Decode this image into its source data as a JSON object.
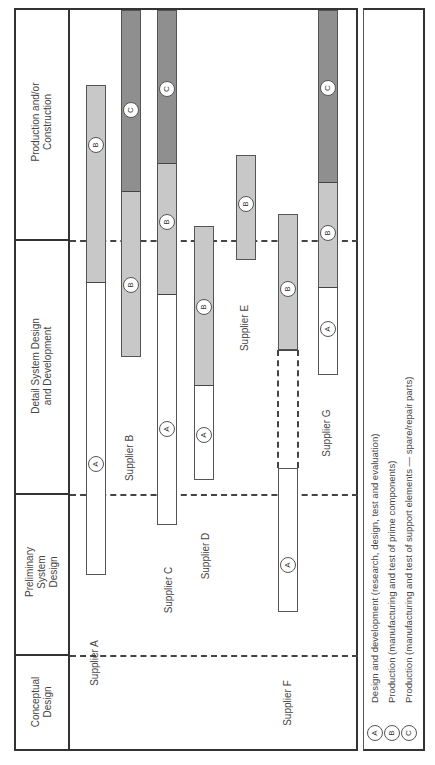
{
  "phases": [
    {
      "key": "production",
      "label": "Production and/or\nConstruction",
      "line1": "Production and/or",
      "line2": "Construction"
    },
    {
      "key": "detail",
      "label": "Detail System Design and Development",
      "line1": "Detail System Design",
      "line2": "and Development"
    },
    {
      "key": "preliminary",
      "label": "Preliminary System Design",
      "line1": "Preliminary",
      "line2": "System",
      "line3": "Design"
    },
    {
      "key": "conceptual",
      "label": "Conceptual Design",
      "line1": "Conceptual",
      "line2": "Design"
    }
  ],
  "suppliers": [
    {
      "name": "Supplier A",
      "segments": [
        {
          "type": "B",
          "label": "B"
        },
        {
          "type": "A",
          "label": "A"
        }
      ]
    },
    {
      "name": "Supplier B",
      "segments": [
        {
          "type": "C",
          "label": "C"
        },
        {
          "type": "B",
          "label": "B"
        }
      ]
    },
    {
      "name": "Supplier C",
      "segments": [
        {
          "type": "C",
          "label": "C"
        },
        {
          "type": "B",
          "label": "B"
        },
        {
          "type": "A",
          "label": "A"
        }
      ]
    },
    {
      "name": "Supplier D",
      "segments": [
        {
          "type": "B",
          "label": "B"
        },
        {
          "type": "A",
          "label": "A"
        }
      ]
    },
    {
      "name": "Supplier E",
      "segments": [
        {
          "type": "B",
          "label": "B"
        }
      ]
    },
    {
      "name": "Supplier F",
      "segments": [
        {
          "type": "B",
          "label": "B"
        },
        {
          "type": "gap",
          "label": ""
        },
        {
          "type": "A",
          "label": "A"
        }
      ]
    },
    {
      "name": "Supplier G",
      "segments": [
        {
          "type": "C",
          "label": "C"
        },
        {
          "type": "B",
          "label": "B"
        },
        {
          "type": "A",
          "label": "A"
        }
      ]
    }
  ],
  "legend": [
    {
      "key": "A",
      "text": "Design and development (research, design, test and evaluation)"
    },
    {
      "key": "B",
      "text": "Production (manufacturing and test of prime components)"
    },
    {
      "key": "C",
      "text": "Production (manufacturing and test of support elements — spare/repair parts)"
    }
  ],
  "colors": {
    "A": "#ffffff",
    "B": "#c8c8c8",
    "C": "#8f8f8f",
    "line": "#333333"
  }
}
